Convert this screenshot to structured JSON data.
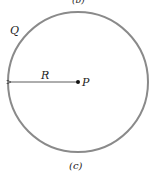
{
  "diagram": {
    "top_caption_partial": "(b)",
    "circle": {
      "cx": 78,
      "cy": 82,
      "r": 70,
      "stroke": "#8a8a8a"
    },
    "charge_label": "Q",
    "radius_label": "R",
    "center_label": "P",
    "caption": "(c)"
  }
}
